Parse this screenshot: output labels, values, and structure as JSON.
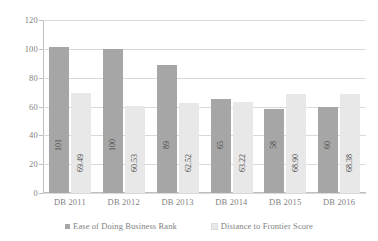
{
  "chart_data": {
    "type": "bar",
    "title": "",
    "xlabel": "",
    "ylabel": "",
    "ylim": [
      0,
      120
    ],
    "ytick_values": [
      0,
      20,
      40,
      60,
      80,
      100,
      120
    ],
    "ytick_labels": [
      "0",
      "20",
      "40",
      "60",
      "80",
      "100",
      "120"
    ],
    "grid": true,
    "legend_position": "bottom",
    "categories": [
      "DB 2011",
      "DB 2012",
      "DB 2013",
      "DB 2014",
      "DB 2015",
      "DB 2016"
    ],
    "series": [
      {
        "name": "Ease of Doing Business Rank",
        "color": "#a6a6a6",
        "values": [
          101,
          100,
          89,
          65,
          58,
          60
        ],
        "labels": [
          "101",
          "100",
          "89",
          "65",
          "58",
          "60"
        ]
      },
      {
        "name": "Distance to Frontier Score",
        "color": "#e8e8e8",
        "values": [
          69.49,
          60.53,
          62.52,
          63.22,
          68.9,
          68.38
        ],
        "labels": [
          "69.49",
          "60.53",
          "62.52",
          "63.22",
          "68.90",
          "68.38"
        ]
      }
    ]
  },
  "axis": {
    "y": {
      "ticks": [
        {
          "label": "120",
          "value": 120
        },
        {
          "label": "100",
          "value": 100
        },
        {
          "label": "80",
          "value": 80
        },
        {
          "label": "60",
          "value": 60
        },
        {
          "label": "40",
          "value": 40
        },
        {
          "label": "20",
          "value": 20
        },
        {
          "label": "0",
          "value": 0
        }
      ]
    },
    "x": {
      "ticks": [
        {
          "label": "DB 2011"
        },
        {
          "label": "DB 2012"
        },
        {
          "label": "DB 2013"
        },
        {
          "label": "DB 2014"
        },
        {
          "label": "DB 2015"
        },
        {
          "label": "DB 2016"
        }
      ]
    }
  },
  "legend": {
    "items": [
      {
        "label": "Ease of Doing Business Rank",
        "color": "#a6a6a6",
        "marker": "square-marker"
      },
      {
        "label": "Distance to Frontier Score",
        "color": "#e8e8e8",
        "marker": "square-marker"
      }
    ]
  }
}
